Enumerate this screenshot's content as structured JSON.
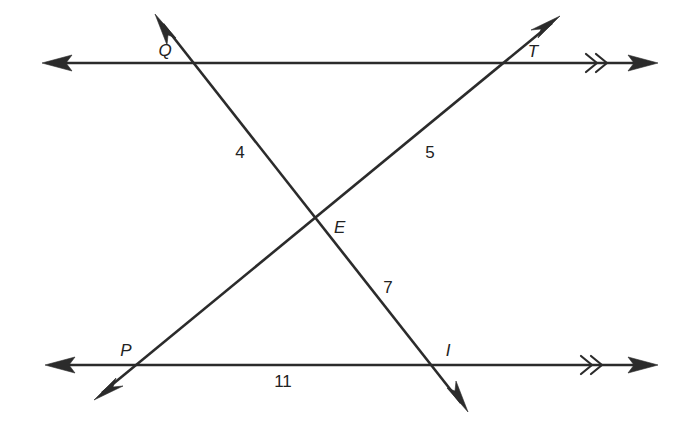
{
  "figure": {
    "type": "geometry-diagram",
    "background_color": "#ffffff",
    "ink_color": "#2b2b2b"
  },
  "points": [
    {
      "id": "Q",
      "label": "Q",
      "x": 196,
      "y": 63,
      "label_x": 165,
      "label_y": 56
    },
    {
      "id": "T",
      "label": "T",
      "x": 503,
      "y": 63,
      "label_x": 533,
      "label_y": 57
    },
    {
      "id": "E",
      "label": "E",
      "x": 316,
      "y": 225,
      "label_x": 334,
      "label_y": 233
    },
    {
      "id": "P",
      "label": "P",
      "x": 133,
      "y": 365,
      "label_x": 126,
      "label_y": 356
    },
    {
      "id": "I",
      "label": "I",
      "x": 438,
      "y": 365,
      "label_x": 448,
      "label_y": 356
    }
  ],
  "angle_labels": [
    {
      "id": "angle-4",
      "text": "4",
      "x": 240,
      "y": 158
    },
    {
      "id": "angle-5",
      "text": "5",
      "x": 430,
      "y": 158
    },
    {
      "id": "angle-7",
      "text": "7",
      "x": 388,
      "y": 293
    },
    {
      "id": "angle-11",
      "text": "11",
      "x": 283,
      "y": 387
    }
  ],
  "lines": [
    {
      "id": "top-parallel-line",
      "kind": "double-arrow-line",
      "x1": 42,
      "y1": 63,
      "x2": 658,
      "y2": 63,
      "parallel_mark": {
        "type": "double-chevron",
        "x": 595,
        "y": 63
      }
    },
    {
      "id": "bottom-parallel-line",
      "kind": "double-arrow-line",
      "x1": 45,
      "y1": 365,
      "x2": 658,
      "y2": 365,
      "parallel_mark": {
        "type": "double-chevron",
        "x": 590,
        "y": 365
      }
    },
    {
      "id": "transversal-QI",
      "kind": "double-arrow-line",
      "x1": 155,
      "y1": 14,
      "x2": 468,
      "y2": 412
    },
    {
      "id": "transversal-PT",
      "kind": "double-arrow-line",
      "x1": 94,
      "y1": 400,
      "x2": 560,
      "y2": 16
    }
  ]
}
